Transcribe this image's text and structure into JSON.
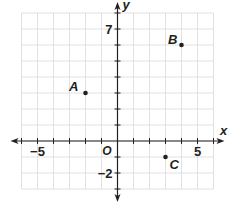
{
  "chart_data": {
    "type": "scatter",
    "title": "",
    "xlabel": "x",
    "ylabel": "y",
    "origin_label": "O",
    "grid": true,
    "xlim": [
      -6,
      6
    ],
    "ylim": [
      -3,
      8
    ],
    "x_tick_labels": [
      {
        "value": -5,
        "label": "−5"
      },
      {
        "value": 5,
        "label": "5"
      }
    ],
    "y_tick_labels": [
      {
        "value": 7,
        "label": "7"
      },
      {
        "value": -2,
        "label": "−2"
      }
    ],
    "points": [
      {
        "label": "A",
        "x": -2,
        "y": 3
      },
      {
        "label": "B",
        "x": 4,
        "y": 6
      },
      {
        "label": "C",
        "x": 3,
        "y": -1
      }
    ]
  }
}
